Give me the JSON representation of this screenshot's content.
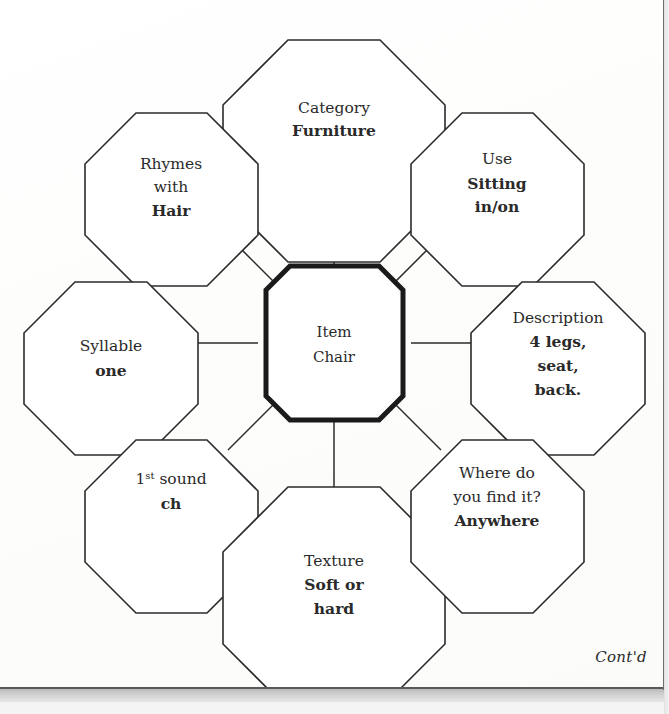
{
  "document": {
    "footer_note": "Cont'd"
  },
  "diagram": {
    "type": "octagon-web-graphic-organizer",
    "center": {
      "label": "Item",
      "value": "Chair"
    },
    "nodes": [
      {
        "id": "category",
        "position": "top",
        "label": "Category",
        "value": "Furniture"
      },
      {
        "id": "use",
        "position": "top-right",
        "label": "Use",
        "value": "Sitting in/on"
      },
      {
        "id": "description",
        "position": "right",
        "label": "Description",
        "value": "4 legs, seat, back."
      },
      {
        "id": "where",
        "position": "bottom-right",
        "label": "Where do you find it?",
        "value": "Anywhere"
      },
      {
        "id": "texture",
        "position": "bottom",
        "label": "Texture",
        "value": "Soft or hard"
      },
      {
        "id": "first-sound",
        "position": "bottom-left",
        "label": "1st sound",
        "value": "ch"
      },
      {
        "id": "syllable",
        "position": "left",
        "label": "Syllable",
        "value": "one"
      },
      {
        "id": "rhymes",
        "position": "top-left",
        "label": "Rhymes with",
        "value": "Hair"
      }
    ],
    "node_text_lines": {
      "category": {
        "label_lines": [
          "Category"
        ],
        "value_lines": [
          "Furniture"
        ]
      },
      "use": {
        "label_lines": [
          "Use"
        ],
        "value_lines": [
          "Sitting",
          "in/on"
        ]
      },
      "description": {
        "label_lines": [
          "Description"
        ],
        "value_lines": [
          "4 legs,",
          "seat,",
          "back."
        ]
      },
      "where": {
        "label_lines": [
          "Where do",
          "you find it?"
        ],
        "value_lines": [
          "Anywhere"
        ]
      },
      "texture": {
        "label_lines": [
          "Texture"
        ],
        "value_lines": [
          "Soft or",
          "hard"
        ]
      },
      "first_sound": {
        "label_base": "1",
        "label_sup": "st",
        "label_rest": " sound",
        "value_lines": [
          "ch"
        ]
      },
      "syllable": {
        "label_lines": [
          "Syllable"
        ],
        "value_lines": [
          "one"
        ]
      },
      "rhymes": {
        "label_lines": [
          "Rhymes",
          "with"
        ],
        "value_lines": [
          "Hair"
        ]
      }
    }
  },
  "colors": {
    "ink": "#2a2a2a",
    "outline": "#2b2b2b",
    "center_outline": "#1a1a1a",
    "paper": "#ffffff",
    "page_edge": "#59595b"
  }
}
